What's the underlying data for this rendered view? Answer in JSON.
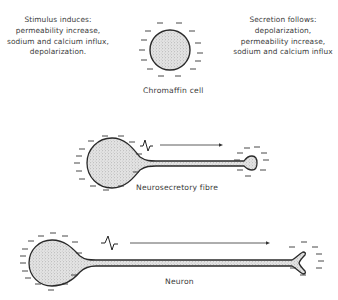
{
  "figure": {
    "left_note": {
      "lines": [
        "Stimulus induces:",
        "permeability increase,",
        "sodium and calcium influx,",
        "depolarization."
      ]
    },
    "right_note": {
      "lines": [
        "Secretion follows:",
        "depolarization,",
        "permeability increase,",
        "sodium and calcium influx"
      ]
    },
    "cells": [
      {
        "id": "chromaffin",
        "label": "Chromaffin cell"
      },
      {
        "id": "neurosecretory",
        "label": "Neurosecretory fibre"
      },
      {
        "id": "neuron",
        "label": "Neuron"
      }
    ],
    "charge_sign": "−",
    "colors": {
      "ink": "#2a2a2a",
      "stipple": "#d8d8d8",
      "text": "#3a3a3a"
    }
  }
}
